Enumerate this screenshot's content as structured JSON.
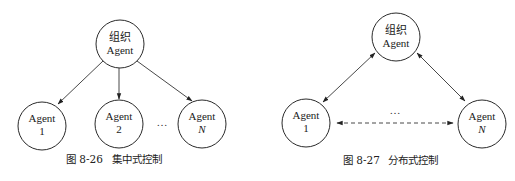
{
  "diagrams": [
    {
      "id": "centralized",
      "caption": {
        "number": "图 8-26",
        "title": "集中式控制"
      },
      "root": {
        "line1": "组织",
        "line2": "Agent"
      },
      "children": [
        {
          "line1": "Agent",
          "line2": "1"
        },
        {
          "line1": "Agent",
          "line2": "2"
        },
        {
          "line1": "Agent",
          "line2": "N"
        }
      ],
      "ellipsis": "…"
    },
    {
      "id": "distributed",
      "caption": {
        "number": "图 8-27",
        "title": "分布式控制"
      },
      "root": {
        "line1": "组织",
        "line2": "Agent"
      },
      "children": [
        {
          "line1": "Agent",
          "line2": "1"
        },
        {
          "line1": "Agent",
          "line2": "N"
        }
      ],
      "ellipsis": "…"
    }
  ],
  "colors": {
    "stroke": "#2a2a2a",
    "text": "#1a1a1a",
    "background": "#ffffff"
  }
}
